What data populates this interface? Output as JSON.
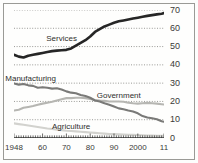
{
  "chart_data": {
    "type": "line",
    "title": "",
    "subtitle": "",
    "xlabel": "",
    "ylabel": "",
    "xlim": [
      1948,
      2011
    ],
    "ylim": [
      0,
      70
    ],
    "grid": true,
    "grid_style": "dotted-horizontal",
    "legend": "inline-series-labels",
    "x_tick_labels": [
      "1948",
      "60",
      "70",
      "80",
      "90",
      "2000",
      "11"
    ],
    "x_tick_values": [
      1948,
      1960,
      1970,
      1980,
      1990,
      2000,
      2011
    ],
    "y_tick_labels": [
      "0",
      "10",
      "20",
      "30",
      "40",
      "50",
      "60",
      "70"
    ],
    "y_tick_values": [
      0,
      10,
      20,
      30,
      40,
      50,
      60,
      70
    ],
    "series": [
      {
        "name": "Services",
        "color": "#262626",
        "label_x": 1968,
        "label_y": 54,
        "x": [
          1948,
          1950,
          1952,
          1954,
          1956,
          1958,
          1960,
          1962,
          1964,
          1966,
          1968,
          1970,
          1972,
          1974,
          1976,
          1978,
          1980,
          1982,
          1984,
          1986,
          1988,
          1990,
          1992,
          1994,
          1996,
          1998,
          2000,
          2002,
          2004,
          2006,
          2008,
          2010,
          2011
        ],
        "values": [
          45.5,
          44.5,
          44.0,
          45.0,
          45.5,
          46.0,
          46.5,
          47.0,
          47.5,
          47.8,
          48.0,
          48.2,
          49.0,
          50.5,
          52.0,
          53.5,
          55.5,
          58.0,
          59.5,
          61.0,
          62.0,
          63.0,
          63.8,
          64.3,
          64.8,
          65.3,
          65.8,
          66.3,
          66.8,
          67.2,
          67.6,
          68.0,
          68.3
        ]
      },
      {
        "name": "Manufacturing",
        "color": "#7a7a78",
        "label_x": 1955,
        "label_y": 32,
        "x": [
          1948,
          1950,
          1952,
          1954,
          1956,
          1958,
          1960,
          1962,
          1964,
          1966,
          1968,
          1970,
          1972,
          1974,
          1976,
          1978,
          1980,
          1982,
          1984,
          1986,
          1988,
          1990,
          1992,
          1994,
          1996,
          1998,
          2000,
          2002,
          2004,
          2006,
          2008,
          2010,
          2011
        ],
        "values": [
          29.8,
          29.2,
          29.5,
          28.8,
          28.5,
          27.5,
          27.8,
          27.5,
          27.0,
          27.2,
          26.5,
          25.5,
          24.8,
          24.5,
          23.5,
          23.0,
          22.0,
          20.5,
          20.0,
          19.0,
          18.2,
          17.2,
          16.2,
          15.7,
          15.0,
          14.5,
          13.5,
          12.0,
          11.2,
          10.8,
          10.3,
          9.2,
          8.9
        ]
      },
      {
        "name": "Government",
        "color": "#b6b6b2",
        "label_x": 1992,
        "label_y": 23,
        "x": [
          1948,
          1950,
          1952,
          1954,
          1956,
          1958,
          1960,
          1962,
          1964,
          1966,
          1968,
          1970,
          1972,
          1974,
          1976,
          1978,
          1980,
          1982,
          1984,
          1986,
          1988,
          1990,
          1992,
          1994,
          1996,
          1998,
          2000,
          2002,
          2004,
          2006,
          2008,
          2010,
          2011
        ],
        "values": [
          15.0,
          15.5,
          16.5,
          17.0,
          17.5,
          18.2,
          18.8,
          19.3,
          19.8,
          20.5,
          21.2,
          21.8,
          21.8,
          22.0,
          22.0,
          21.8,
          21.3,
          20.8,
          20.5,
          20.3,
          20.0,
          20.0,
          20.0,
          19.8,
          19.3,
          19.0,
          18.8,
          19.0,
          19.2,
          19.0,
          18.8,
          18.5,
          18.3
        ]
      },
      {
        "name": "Agriculture",
        "color": "#d2d2ce",
        "label_x": 1972,
        "label_y": 6,
        "x": [
          1948,
          1950,
          1952,
          1954,
          1956,
          1958,
          1960,
          1962,
          1964,
          1966,
          1968,
          1970,
          1972,
          1974,
          1976,
          1978,
          1980,
          1982,
          1984,
          1986,
          1988,
          1990,
          1992,
          1994,
          1996,
          1998,
          2000,
          2002,
          2004,
          2006,
          2008,
          2010,
          2011
        ],
        "values": [
          8.0,
          7.6,
          7.2,
          6.8,
          6.4,
          6.0,
          5.6,
          5.2,
          4.9,
          4.6,
          4.3,
          4.0,
          3.8,
          3.6,
          3.4,
          3.2,
          3.0,
          2.8,
          2.6,
          2.4,
          2.2,
          2.1,
          2.0,
          1.9,
          1.8,
          1.7,
          1.6,
          1.5,
          1.4,
          1.3,
          1.25,
          1.2,
          1.15
        ]
      }
    ]
  },
  "colors": {
    "frame": "#9a9a96",
    "background": "#fefefd",
    "gridline": "#8f8f8b",
    "axis": "#2e2e2c",
    "tick_text": "#3a3a38"
  }
}
